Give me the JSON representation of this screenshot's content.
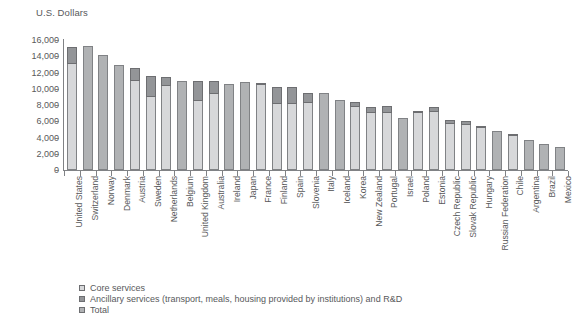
{
  "chart_data": {
    "type": "bar",
    "title": "",
    "subtitle": "",
    "ylabel": "U.S. Dollars",
    "xlabel": "",
    "ylim": [
      0,
      16000
    ],
    "ytick_labels": [
      "16,000",
      "14,000",
      "12,000",
      "10,000",
      "8,000",
      "6,000",
      "4,000",
      "2,000",
      "0"
    ],
    "ytick_values": [
      16000,
      14000,
      12000,
      10000,
      8000,
      6000,
      4000,
      2000,
      0
    ],
    "grid": false,
    "legend_position": "bottom-left",
    "stacked": true,
    "legend": [
      {
        "key": "core",
        "label": "Core services",
        "color": "#d7d8da"
      },
      {
        "key": "ancillary",
        "label": "Ancillary services (transport, meals, housing provided by institutions) and R&D",
        "color": "#939598"
      },
      {
        "key": "total",
        "label": "Total",
        "color": "#b0b2b4"
      }
    ],
    "categories": [
      "United States",
      "Switzerland",
      "Norway",
      "Denmark",
      "Austria",
      "Sweden",
      "Netherlands",
      "Belgium",
      "United Kingdom",
      "Australia",
      "Ireland",
      "Japan",
      "France",
      "Finland",
      "Spain",
      "Slovenia",
      "Italy",
      "Iceland",
      "Korea",
      "New Zealand",
      "Portugal",
      "Israel",
      "Poland",
      "Estonia",
      "Czech Republic",
      "Slovak Republic",
      "Hungary",
      "Russian Federation",
      "Chile",
      "Argentina",
      "Brazil",
      "Mexico"
    ],
    "series": [
      {
        "name": "Core services",
        "values": [
          13000,
          null,
          null,
          null,
          10900,
          9000,
          10300,
          null,
          8500,
          9400,
          null,
          null,
          10700,
          8100,
          8100,
          8300,
          null,
          null,
          7700,
          7000,
          7000,
          null,
          7200,
          7200,
          5700,
          5600,
          5300,
          null,
          4200,
          null,
          null,
          null
        ]
      },
      {
        "name": "Ancillary services (transport, meals, housing provided by institutions) and R&D",
        "values": [
          2200,
          null,
          null,
          null,
          1700,
          2600,
          1200,
          null,
          2400,
          1500,
          null,
          null,
          0,
          2100,
          2100,
          1200,
          null,
          null,
          700,
          700,
          900,
          null,
          100,
          600,
          400,
          400,
          100,
          null,
          200,
          null,
          null,
          null
        ]
      },
      {
        "name": "Total",
        "values": [
          null,
          15300,
          14100,
          12900,
          null,
          null,
          null,
          11000,
          null,
          null,
          10600,
          10800,
          null,
          null,
          null,
          null,
          9500,
          8600,
          null,
          null,
          null,
          6400,
          null,
          null,
          null,
          null,
          null,
          4800,
          null,
          3700,
          3200,
          2800
        ]
      }
    ],
    "totals": [
      15200,
      15300,
      14100,
      12900,
      12600,
      11600,
      11500,
      11000,
      10900,
      10900,
      10600,
      10800,
      10700,
      10200,
      10200,
      9500,
      9500,
      8600,
      8400,
      7700,
      7900,
      6400,
      7300,
      7800,
      6100,
      6000,
      5400,
      4800,
      4400,
      3700,
      3200,
      2800
    ]
  }
}
